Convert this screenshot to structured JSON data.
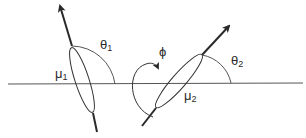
{
  "diagram": {
    "type": "dipole-orientation",
    "labels": {
      "theta1": {
        "sym": "θ",
        "sub": "1"
      },
      "theta2": {
        "sym": "θ",
        "sub": "2"
      },
      "phi": {
        "sym": "ϕ"
      },
      "mu1": {
        "sym": "μ",
        "sub": "1"
      },
      "mu2": {
        "sym": "μ",
        "sub": "2"
      }
    },
    "colors": {
      "stroke": "#2a2a2a",
      "thin": "#555555",
      "background": "#ffffff"
    }
  }
}
